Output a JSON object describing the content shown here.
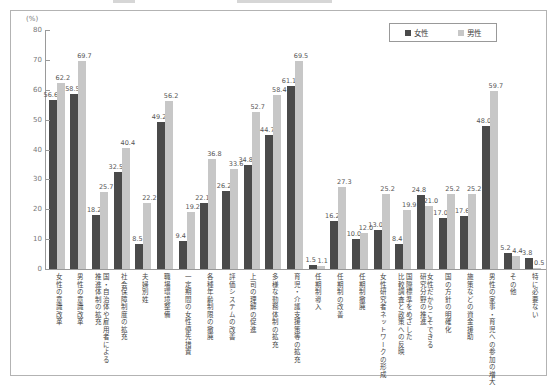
{
  "chart_data": {
    "type": "bar",
    "unit_label": "(%)",
    "ylim": [
      0,
      80
    ],
    "yticks": [
      0,
      10,
      20,
      30,
      40,
      50,
      60,
      70,
      80
    ],
    "grid": false,
    "legend_position": "top-right",
    "legend": [
      {
        "name": "女性",
        "color": "#4a4a4a"
      },
      {
        "name": "男性",
        "color": "#c7c7c7"
      }
    ],
    "categories": [
      [
        "女性の意識改革"
      ],
      [
        "男性の意識改革"
      ],
      [
        "国・自治体や雇用者による",
        "推進体制の拡充"
      ],
      [
        "社会保障制度の拡充"
      ],
      [
        "夫婦別姓"
      ],
      [
        "職場環境整備"
      ],
      [
        "一定期間の女性優先措置"
      ],
      [
        "各種年齢制限の撤廃"
      ],
      [
        "評価システムの改善"
      ],
      [
        "上司の理解の促進"
      ],
      [
        "多様な勤務体制の拡充"
      ],
      [
        "育児・介護支援策等の拡充"
      ],
      [
        "任期制導入"
      ],
      [
        "任期制の改善"
      ],
      [
        "任期制撤廃"
      ],
      [
        "女性研究者ネットワークの形成"
      ],
      [
        "国際標準をめざした",
        "比較調査と政策への反映"
      ],
      [
        "女性だからこそできる",
        "研究分野の推進"
      ],
      [
        "国の方針の明確化"
      ],
      [
        "施策などの資金援助"
      ],
      [
        "男性の家事・育児への参加の増大"
      ],
      [
        "その他"
      ],
      [
        "特に必要ない"
      ]
    ],
    "series": [
      {
        "name": "女性",
        "values": [
          56.6,
          58.5,
          18.2,
          32.5,
          8.5,
          49.2,
          9.4,
          22.1,
          26.2,
          34.8,
          44.7,
          61.1,
          1.5,
          16.2,
          10.0,
          13.0,
          8.4,
          24.8,
          17.0,
          17.6,
          48.0,
          5.2,
          3.8
        ]
      },
      {
        "name": "男性",
        "values": [
          62.2,
          69.7,
          25.7,
          40.4,
          22.2,
          56.2,
          19.2,
          36.8,
          33.6,
          52.7,
          58.4,
          69.5,
          1.1,
          27.3,
          12.0,
          25.2,
          19.9,
          21.0,
          25.2,
          25.2,
          59.7,
          4.4,
          0.5
        ]
      }
    ]
  }
}
